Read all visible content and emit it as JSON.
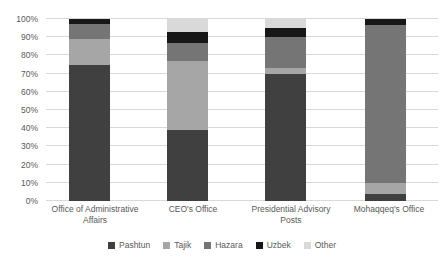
{
  "chart_data": {
    "type": "bar",
    "subtype": "stacked-100-percent-column",
    "title": "",
    "xlabel": "",
    "ylabel": "",
    "ylim": [
      0,
      100
    ],
    "grid": true,
    "legend_position": "bottom",
    "y_tick_labels": [
      "0%",
      "10%",
      "20%",
      "30%",
      "40%",
      "50%",
      "60%",
      "70%",
      "80%",
      "90%",
      "100%"
    ],
    "y_tick_values": [
      0,
      10,
      20,
      30,
      40,
      50,
      60,
      70,
      80,
      90,
      100
    ],
    "categories": [
      "Office of Administrative Affairs",
      "CEO's Office",
      "Presidential Advisory Posts",
      "Mohaqqeq's Office"
    ],
    "series": [
      {
        "name": "Pashtun",
        "color": "#404040",
        "values": [
          75,
          39,
          70,
          4
        ]
      },
      {
        "name": "Tajik",
        "color": "#a6a6a6",
        "values": [
          14,
          38,
          3,
          6
        ]
      },
      {
        "name": "Hazara",
        "color": "#757575",
        "values": [
          8,
          10,
          17,
          87
        ]
      },
      {
        "name": "Uzbek",
        "color": "#171717",
        "values": [
          3,
          6,
          5,
          3
        ]
      },
      {
        "name": "Other",
        "color": "#d9d9d9",
        "values": [
          0,
          7,
          5,
          0
        ]
      }
    ]
  },
  "style_colors": {
    "gridline": "#d9d9d9",
    "axis_text": "#595959",
    "background": "#ffffff"
  }
}
